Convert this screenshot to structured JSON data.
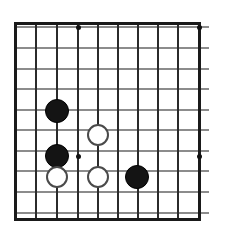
{
  "diagram": {
    "type": "go-board",
    "board": {
      "width_px": 226,
      "height_px": 233,
      "background_color": "#ffffff",
      "columns": 10,
      "rows": 10,
      "cell_size_px": 20.4,
      "origin_x_px": 15,
      "origin_y_px": 27,
      "vertical_line_color": "#2b2b2b",
      "horizontal_line_color": "#8c8c8c",
      "edge_color": "#1a1a1a",
      "vertical_line_x": [
        15,
        36,
        57,
        78,
        98,
        118,
        138,
        158,
        178,
        199
      ],
      "horizontal_line_y": [
        27,
        48,
        69,
        89,
        110,
        130,
        151,
        171,
        192,
        213
      ],
      "top_edge_y": 22,
      "bottom_edge_y": 218,
      "left_edge_x": 15,
      "right_edge_x": 199
    },
    "star_points": [
      {
        "name": "hoshi-c4-r1",
        "x": 78,
        "y": 27
      },
      {
        "name": "hoshi-c10-r1",
        "x": 199,
        "y": 27
      },
      {
        "name": "hoshi-c4-r7",
        "x": 78,
        "y": 156
      },
      {
        "name": "hoshi-c10-r7",
        "x": 199,
        "y": 156
      }
    ],
    "stones": [
      {
        "name": "black-stone-1",
        "color": "black",
        "x": 57,
        "y": 111,
        "radius": 12
      },
      {
        "name": "white-stone-1",
        "color": "white",
        "x": 98,
        "y": 135,
        "radius": 11
      },
      {
        "name": "black-stone-2",
        "color": "black",
        "x": 57,
        "y": 156,
        "radius": 12
      },
      {
        "name": "white-stone-2",
        "color": "white",
        "x": 57,
        "y": 177,
        "radius": 11
      },
      {
        "name": "white-stone-3",
        "color": "white",
        "x": 98,
        "y": 177,
        "radius": 11
      },
      {
        "name": "black-stone-3",
        "color": "black",
        "x": 137,
        "y": 177,
        "radius": 12
      }
    ],
    "colors": {
      "black_stone": "#141414",
      "white_stone_fill": "#ffffff",
      "white_stone_border": "#4a4a4a",
      "star_point": "#111111"
    }
  }
}
